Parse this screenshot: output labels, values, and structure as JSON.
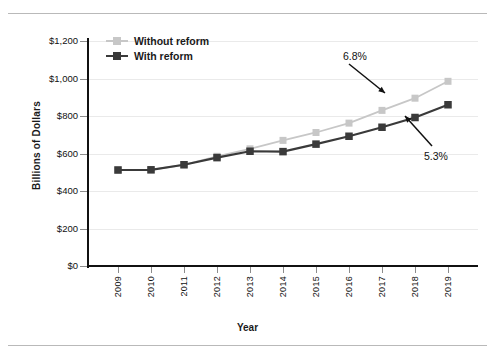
{
  "chart_data": {
    "type": "line",
    "title": "",
    "xlabel": "Year",
    "ylabel": "Billions of Dollars",
    "categories": [
      "2009",
      "2010",
      "2011",
      "2012",
      "2013",
      "2014",
      "2015",
      "2016",
      "2017",
      "2018",
      "2019"
    ],
    "x": [
      2009,
      2010,
      2011,
      2012,
      2013,
      2014,
      2015,
      2016,
      2017,
      2018,
      2019
    ],
    "ylim": [
      0,
      1200
    ],
    "yticks": [
      0,
      200,
      400,
      600,
      800,
      1000,
      1200
    ],
    "ytick_labels": [
      "$0",
      "$200",
      "$400",
      "$600",
      "$800",
      "$1,000",
      "$1,200"
    ],
    "grid": true,
    "legend_position": "top-left",
    "series": [
      {
        "name": "Without reform",
        "color": "#c7c7c7",
        "values": [
          512,
          513,
          540,
          585,
          625,
          670,
          712,
          762,
          830,
          895,
          985
        ]
      },
      {
        "name": "With reform",
        "color": "#3a3a3a",
        "values": [
          512,
          513,
          540,
          578,
          612,
          610,
          650,
          692,
          740,
          792,
          860
        ]
      }
    ],
    "annotations": [
      {
        "text": "6.8%",
        "series": "Without reform",
        "points_at_year": 2016
      },
      {
        "text": "5.3%",
        "series": "With reform",
        "points_at_year": 2017
      }
    ]
  },
  "legend": {
    "items": [
      {
        "label": "Without reform"
      },
      {
        "label": "With reform"
      }
    ]
  },
  "axis": {
    "y_title": "Billions of Dollars",
    "x_title": "Year"
  }
}
